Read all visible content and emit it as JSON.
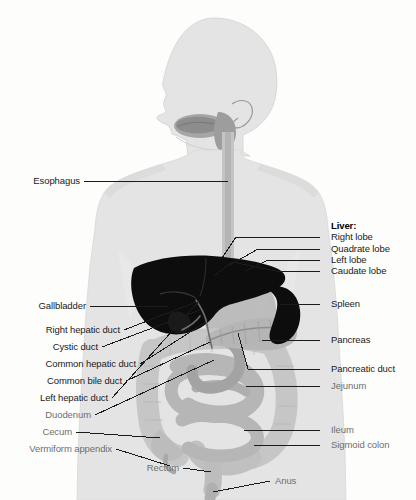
{
  "figure": {
    "background_color": "#fdfdfc",
    "body_silhouette_color": "#e2e2e2",
    "organ_dark_color": "#0d0d0d",
    "organ_mid_color": "#9a9a9a",
    "organ_light_color": "#c9c9c9",
    "leader_line_color": "#1b1b1b"
  },
  "labels_left": [
    {
      "id": "esophagus",
      "text": "Esophagus",
      "style": "dark"
    },
    {
      "id": "gallbladder",
      "text": "Gallbladder",
      "style": "dark"
    },
    {
      "id": "right-hepatic-duct",
      "text": "Right hepatic duct",
      "style": "dark"
    },
    {
      "id": "cystic-duct",
      "text": "Cystic duct",
      "style": "dark"
    },
    {
      "id": "common-hepatic-duct",
      "text": "Common hepatic duct",
      "style": "dark"
    },
    {
      "id": "common-bile-duct",
      "text": "Common bile duct",
      "style": "dark"
    },
    {
      "id": "left-hepatic-duct",
      "text": "Left hepatic duct",
      "style": "dark"
    },
    {
      "id": "duodenum",
      "text": "Duodenum",
      "style": "gray"
    },
    {
      "id": "cecum",
      "text": "Cecum",
      "style": "gray"
    },
    {
      "id": "vermiform-appendix",
      "text": "Vermiform appendix",
      "style": "gray"
    }
  ],
  "labels_right": [
    {
      "id": "liver-heading",
      "text": "Liver:",
      "style": "bold"
    },
    {
      "id": "right-lobe",
      "text": "Right lobe",
      "style": "dark"
    },
    {
      "id": "quadrate-lobe",
      "text": "Quadrate lobe",
      "style": "dark"
    },
    {
      "id": "left-lobe",
      "text": "Left lobe",
      "style": "dark"
    },
    {
      "id": "caudate-lobe",
      "text": "Caudate lobe",
      "style": "dark"
    },
    {
      "id": "spleen",
      "text": "Spleen",
      "style": "dark"
    },
    {
      "id": "pancreas",
      "text": "Pancreas",
      "style": "dark"
    },
    {
      "id": "pancreatic-duct",
      "text": "Pancreatic duct",
      "style": "dark"
    },
    {
      "id": "jejunum",
      "text": "Jejunum",
      "style": "gray"
    },
    {
      "id": "ileum",
      "text": "Ileum",
      "style": "gray"
    },
    {
      "id": "sigmoid-colon",
      "text": "Sigmoid colon",
      "style": "gray"
    }
  ],
  "labels_bottom": [
    {
      "id": "rectum",
      "text": "Rectum",
      "style": "gray"
    },
    {
      "id": "anus",
      "text": "Anus",
      "style": "gray"
    }
  ]
}
